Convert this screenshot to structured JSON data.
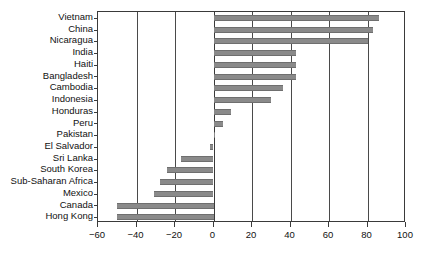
{
  "chart_data": {
    "type": "bar",
    "orientation": "horizontal",
    "title": "",
    "subtitle": "",
    "xlabel": "",
    "ylabel": "",
    "xlim": [
      -60,
      100
    ],
    "xticks": [
      -60,
      -40,
      -20,
      0,
      20,
      40,
      60,
      80,
      100
    ],
    "xtick_labels": [
      "−60",
      "−40",
      "−20",
      "0",
      "20",
      "40",
      "60",
      "80",
      "100"
    ],
    "grid": true,
    "grid_axis": "x",
    "legend": "none",
    "zero_reference_line": true,
    "bar_color": "#8a8a8a",
    "axis_color": "#3a3a3a",
    "categories": [
      "Vietnam",
      "China",
      "Nicaragua",
      "India",
      "Haiti",
      "Bangladesh",
      "Cambodia",
      "Indonesia",
      "Honduras",
      "Peru",
      "Pakistan",
      "El Salvador",
      "Sri Lanka",
      "South Korea",
      "Sub-Saharan Africa",
      "Mexico",
      "Canada",
      "Hong Kong"
    ],
    "values": [
      86,
      83,
      80,
      43,
      43,
      43,
      36,
      30,
      9,
      5,
      1,
      -2,
      -17,
      -24,
      -28,
      -31,
      -50,
      -50
    ]
  }
}
